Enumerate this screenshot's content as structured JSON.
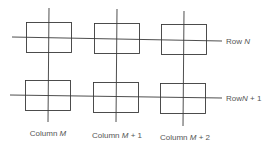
{
  "diagram": {
    "rows": [
      {
        "label": "Row ",
        "var": "N",
        "suffix": ""
      },
      {
        "label": "Row",
        "var": "N",
        "suffix": " + 1"
      }
    ],
    "columns": [
      {
        "label": "Column ",
        "var": "M",
        "suffix": ""
      },
      {
        "label": "Column ",
        "var": "M",
        "suffix": " + 1"
      },
      {
        "label": "Column ",
        "var": "M",
        "suffix": " + 2"
      }
    ],
    "colors": {
      "line": "#3a3a3a",
      "text": "#555555",
      "background": "#ffffff"
    }
  }
}
